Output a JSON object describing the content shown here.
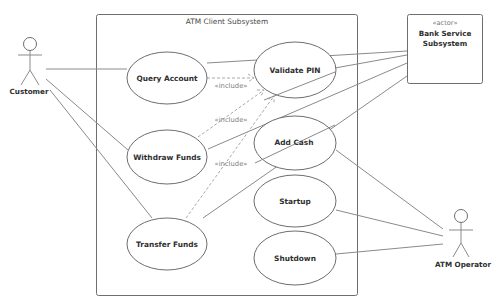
{
  "diagram": {
    "type": "UML use case diagram",
    "system_boundary": {
      "title": "ATM Client Subsystem"
    },
    "actors": [
      {
        "id": "customer",
        "label": "Customer",
        "kind": "stick-figure"
      },
      {
        "id": "atm_operator",
        "label": "ATM Operator",
        "kind": "stick-figure"
      },
      {
        "id": "bank",
        "stereotype": "«actor»",
        "label": "Bank Service Subsystem",
        "label_lines": [
          "Bank Service",
          "Subsystem"
        ],
        "kind": "box"
      }
    ],
    "use_cases": [
      {
        "id": "query_account",
        "label": "Query Account"
      },
      {
        "id": "validate_pin",
        "label": "Validate PIN"
      },
      {
        "id": "withdraw_funds",
        "label": "Withdraw Funds"
      },
      {
        "id": "add_cash",
        "label": "Add Cash"
      },
      {
        "id": "transfer_funds",
        "label": "Transfer Funds"
      },
      {
        "id": "startup",
        "label": "Startup"
      },
      {
        "id": "shutdown",
        "label": "Shutdown"
      }
    ],
    "include_label": "«include»",
    "includes": [
      {
        "from": "Query Account",
        "to": "Validate PIN",
        "label": "«include»"
      },
      {
        "from": "Withdraw Funds",
        "to": "Validate PIN",
        "label": "«include»"
      },
      {
        "from": "Transfer Funds",
        "to": "Validate PIN",
        "label": "«include»"
      }
    ],
    "associations": [
      {
        "actor": "Customer",
        "use_case": "Query Account"
      },
      {
        "actor": "Customer",
        "use_case": "Withdraw Funds"
      },
      {
        "actor": "Customer",
        "use_case": "Transfer Funds"
      },
      {
        "actor": "Bank Service Subsystem",
        "use_case": "Query Account"
      },
      {
        "actor": "Bank Service Subsystem",
        "use_case": "Validate PIN"
      },
      {
        "actor": "Bank Service Subsystem",
        "use_case": "Withdraw Funds"
      },
      {
        "actor": "Bank Service Subsystem",
        "use_case": "Transfer Funds"
      },
      {
        "actor": "ATM Operator",
        "use_case": "Add Cash"
      },
      {
        "actor": "ATM Operator",
        "use_case": "Startup"
      },
      {
        "actor": "ATM Operator",
        "use_case": "Shutdown"
      }
    ],
    "colors": {
      "line": "#8a8a8a",
      "dashed": "#a9a9a9",
      "border": "#6e6e6e",
      "text": "#2f2f2f"
    }
  }
}
